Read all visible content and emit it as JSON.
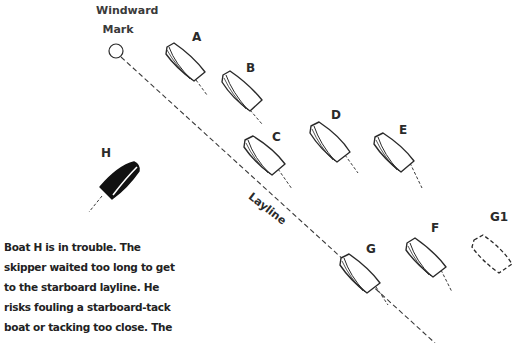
{
  "mark": {
    "label_line1": "Windward",
    "label_line2": "Mark"
  },
  "layline": {
    "label": "Layline"
  },
  "boats": [
    {
      "id": "A",
      "label": "A",
      "style": "outline"
    },
    {
      "id": "B",
      "label": "B",
      "style": "outline"
    },
    {
      "id": "C",
      "label": "C",
      "style": "outline"
    },
    {
      "id": "D",
      "label": "D",
      "style": "outline"
    },
    {
      "id": "E",
      "label": "E",
      "style": "outline"
    },
    {
      "id": "F",
      "label": "F",
      "style": "outline"
    },
    {
      "id": "G",
      "label": "G",
      "style": "outline"
    },
    {
      "id": "G1",
      "label": "G1",
      "style": "dashed-ghost"
    },
    {
      "id": "H",
      "label": "H",
      "style": "filled-black"
    }
  ],
  "caption": {
    "lines": [
      "Boat H is in trouble. The",
      "skipper waited too long to get",
      "to the starboard layline. He",
      "risks fouling a starboard-tack",
      "boat or tacking too close. The"
    ]
  },
  "colors": {
    "ink": "#2a2a2a",
    "background": "#ffffff"
  }
}
